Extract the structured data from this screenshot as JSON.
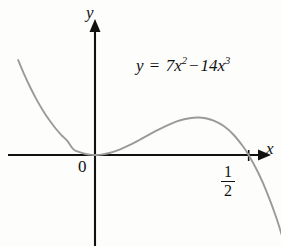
{
  "figure": {
    "background_color": "#fdfdfc",
    "axis_color": "#111111",
    "curve_color": "#9a9a9a"
  },
  "axes": {
    "y_label": "y",
    "x_label": "x",
    "origin_label": "0"
  },
  "equation": {
    "lhs": "y",
    "equals": "=",
    "coefficient_quadratic": "7",
    "variable": "x",
    "exponent_quadratic": "2",
    "operator": "−",
    "coefficient_cubic": "14",
    "exponent_cubic": "3"
  },
  "tick": {
    "numerator": "1",
    "denominator": "2"
  },
  "chart_data": {
    "type": "line",
    "title": "",
    "xlabel": "x",
    "ylabel": "y",
    "grid": false,
    "legend": "none",
    "annotations": [
      "y = 7x² − 14x³"
    ],
    "tick_labels": {
      "x": [
        "0",
        "1/2"
      ],
      "y": []
    },
    "xlim": [
      -0.255,
      0.63
    ],
    "ylim": [
      -0.72,
      0.98
    ],
    "roots": [
      0,
      0.5
    ],
    "local_maximum": {
      "x": 0.3333,
      "y": 0.2593
    },
    "series": [
      {
        "name": "y = 7x^2 - 14x^3",
        "color": "#9a9a9a",
        "x": [
          -0.25,
          -0.23,
          -0.21,
          -0.19,
          -0.17,
          -0.15,
          -0.13,
          -0.11,
          -0.09,
          -0.07,
          -0.05,
          -0.03,
          -0.01,
          0.0,
          0.02,
          0.05,
          0.08,
          0.11,
          0.14,
          0.17,
          0.2,
          0.23,
          0.26,
          0.29,
          0.3333,
          0.36,
          0.39,
          0.42,
          0.45,
          0.48,
          0.5,
          0.53,
          0.56,
          0.59,
          0.62
        ],
        "y": [
          0.656,
          0.5555,
          0.4645,
          0.3826,
          0.3096,
          0.2449,
          0.1882,
          0.1394,
          0.0969,
          0.0391,
          0.0193,
          0.0067,
          0.0007,
          0.0,
          0.0027,
          0.0158,
          0.0376,
          0.0661,
          0.0987,
          0.1334,
          0.168,
          0.2,
          0.2272,
          0.2473,
          0.2593,
          0.254,
          0.234,
          0.198,
          0.1417,
          0.0638,
          0.0,
          -0.1176,
          -0.2613,
          -0.4338,
          -0.638
        ]
      }
    ]
  }
}
